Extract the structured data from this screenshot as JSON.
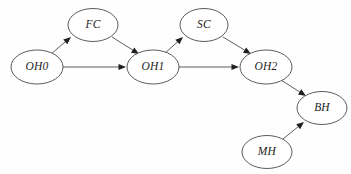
{
  "figure": {
    "kind": "directed-acyclic-graph",
    "background_color": "#fefefe",
    "node_fill_color": "#ffffff",
    "node_stroke_color": "#4a4a4a",
    "edge_color": "#555555",
    "arrowhead_color": "#1f1f1f",
    "label_color": "#1d1d1d",
    "width": 351,
    "height": 174
  },
  "nodes": [
    {
      "id": "OH0",
      "label": "OH0",
      "cx": 37,
      "cy": 67,
      "rx": 26,
      "ry": 17
    },
    {
      "id": "FC",
      "label": "FC",
      "cx": 93,
      "cy": 25,
      "rx": 25,
      "ry": 16.5
    },
    {
      "id": "OH1",
      "label": "OH1",
      "cx": 153,
      "cy": 67,
      "rx": 26,
      "ry": 17
    },
    {
      "id": "SC",
      "label": "SC",
      "cx": 204,
      "cy": 25,
      "rx": 24,
      "ry": 16.5
    },
    {
      "id": "OH2",
      "label": "OH2",
      "cx": 266,
      "cy": 67,
      "rx": 26,
      "ry": 17
    },
    {
      "id": "BH",
      "label": "BH",
      "cx": 322,
      "cy": 108,
      "rx": 25,
      "ry": 16.5
    },
    {
      "id": "MH",
      "label": "MH",
      "cx": 267,
      "cy": 152,
      "rx": 25,
      "ry": 16.5
    }
  ],
  "edges": [
    {
      "from": "OH0",
      "to": "FC",
      "x1": 51,
      "y1": 54,
      "x2": 71,
      "y2": 37,
      "curved": false
    },
    {
      "from": "OH0",
      "to": "OH1",
      "x1": 63,
      "y1": 67,
      "x2": 126,
      "y2": 67,
      "curved": false
    },
    {
      "from": "FC",
      "to": "OH1",
      "x1": 112,
      "y1": 37,
      "x2": 139,
      "y2": 54,
      "curved": false
    },
    {
      "from": "OH1",
      "to": "SC",
      "x1": 164,
      "y1": 54,
      "x2": 183,
      "y2": 37,
      "curved": false
    },
    {
      "from": "OH1",
      "to": "OH2",
      "x1": 179,
      "y1": 67,
      "x2": 239,
      "y2": 67,
      "curved": false
    },
    {
      "from": "SC",
      "to": "OH2",
      "x1": 223,
      "y1": 37,
      "x2": 251,
      "y2": 54,
      "curved": false
    },
    {
      "from": "OH2",
      "to": "BH",
      "x1": 281,
      "y1": 80,
      "x2": 306,
      "y2": 96,
      "curved": false
    },
    {
      "from": "MH",
      "to": "BH",
      "x1": 283,
      "y1": 139,
      "x2": 304,
      "y2": 122,
      "curved": false
    }
  ]
}
